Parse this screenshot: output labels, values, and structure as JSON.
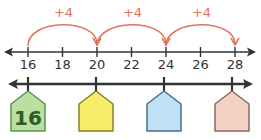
{
  "diagram": {
    "top_number_line": {
      "ticks": [
        "16",
        "18",
        "20",
        "22",
        "24",
        "26",
        "28"
      ],
      "jumps": [
        {
          "label": "+4",
          "from": "16",
          "to": "20"
        },
        {
          "label": "+4",
          "from": "20",
          "to": "24"
        },
        {
          "label": "+4",
          "from": "24",
          "to": "28"
        }
      ],
      "arc_color": "#e0735a"
    },
    "bottom_number_line": {
      "tags": [
        {
          "value": "16",
          "fill": "#b9e0a0",
          "stroke": "#5f8f4e"
        },
        {
          "value": "",
          "fill": "#f5ec6a",
          "stroke": "#8a7d2a"
        },
        {
          "value": "",
          "fill": "#bfe0f5",
          "stroke": "#4a6a85"
        },
        {
          "value": "",
          "fill": "#f4cfc4",
          "stroke": "#8a6a62"
        }
      ]
    }
  }
}
